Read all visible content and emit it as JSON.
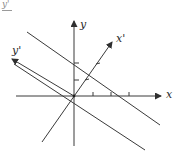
{
  "figure": {
    "corner_label": "y'",
    "axes": {
      "x_label": "x",
      "y_label": "y",
      "x_prime_label": "x'",
      "y_prime_label": "y'"
    },
    "colors": {
      "stroke": "#3a3a3a",
      "label": "#2a2a2a",
      "background": "#ffffff"
    },
    "origin": [
      74,
      96
    ],
    "x_axis_ticks": 3,
    "y_axis_ticks": 2,
    "x_prime_ticks": 2,
    "parallel_lines": 2
  }
}
